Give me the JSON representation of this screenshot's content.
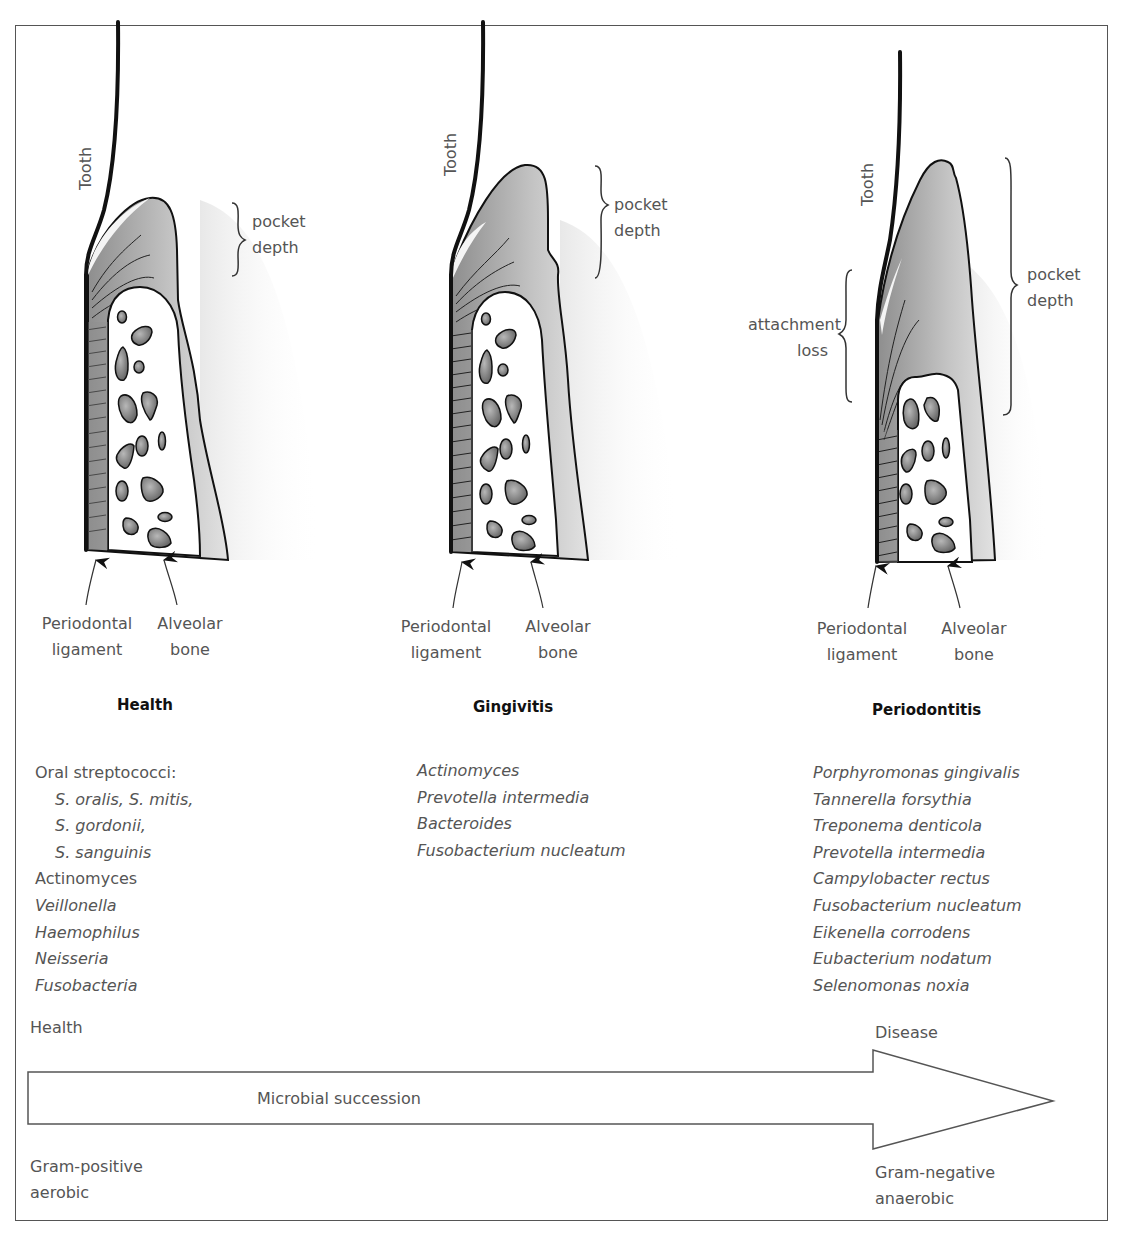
{
  "panels": [
    {
      "id": "health",
      "title": "Health",
      "tooth_label": "Tooth",
      "pocket_label": [
        "pocket",
        "depth"
      ],
      "ligament_label": [
        "Periodontal",
        "ligament"
      ],
      "bone_label": [
        "Alveolar",
        "bone"
      ],
      "species": [
        {
          "text": "Oral streptococci:",
          "style": "plain"
        },
        {
          "text": "S. oralis, S. mitis,",
          "style": "indent"
        },
        {
          "text": "S. gordonii,",
          "style": "indent"
        },
        {
          "text": "S. sanguinis",
          "style": "indent"
        },
        {
          "text": "Actinomyces",
          "style": "plain"
        },
        {
          "text": "Veillonella",
          "style": "italic"
        },
        {
          "text": "Haemophilus",
          "style": "italic"
        },
        {
          "text": "Neisseria",
          "style": "italic"
        },
        {
          "text": "Fusobacteria",
          "style": "italic"
        }
      ]
    },
    {
      "id": "gingivitis",
      "title": "Gingivitis",
      "tooth_label": "Tooth",
      "pocket_label": [
        "pocket",
        "depth"
      ],
      "ligament_label": [
        "Periodontal",
        "ligament"
      ],
      "bone_label": [
        "Alveolar",
        "bone"
      ],
      "species": [
        {
          "text": "Actinomyces",
          "style": "italic"
        },
        {
          "text": "Prevotella intermedia",
          "style": "italic"
        },
        {
          "text": "Bacteroides",
          "style": "italic"
        },
        {
          "text": "Fusobacterium nucleatum",
          "style": "italic"
        }
      ]
    },
    {
      "id": "periodontitis",
      "title": "Periodontitis",
      "tooth_label": "Tooth",
      "pocket_label": [
        "pocket",
        "depth"
      ],
      "attachment_label": [
        "attachment",
        "loss"
      ],
      "ligament_label": [
        "Periodontal",
        "ligament"
      ],
      "bone_label": [
        "Alveolar",
        "bone"
      ],
      "species": [
        {
          "text": "Porphyromonas gingivalis",
          "style": "italic"
        },
        {
          "text": "Tannerella forsythia",
          "style": "italic"
        },
        {
          "text": "Treponema denticola",
          "style": "italic"
        },
        {
          "text": "Prevotella intermedia",
          "style": "italic"
        },
        {
          "text": "Campylobacter rectus",
          "style": "italic"
        },
        {
          "text": "Fusobacterium nucleatum",
          "style": "italic"
        },
        {
          "text": "Eikenella corrodens",
          "style": "italic"
        },
        {
          "text": "Eubacterium nodatum",
          "style": "italic"
        },
        {
          "text": "Selenomonas noxia",
          "style": "italic"
        }
      ]
    }
  ],
  "succession": {
    "start_label": "Health",
    "end_label": "Disease",
    "arrow_label": "Microbial succession",
    "start_type": [
      "Gram-positive",
      "aerobic"
    ],
    "end_type": [
      "Gram-negative",
      "anaerobic"
    ]
  },
  "colors": {
    "outline": "#111111",
    "gingiva_dark": "#8a8a8a",
    "gingiva_light": "#d6d6d6",
    "bone_fill": "#ffffff",
    "trabecula": "#7a7a7a",
    "text": "#555555",
    "frame": "#555555"
  }
}
